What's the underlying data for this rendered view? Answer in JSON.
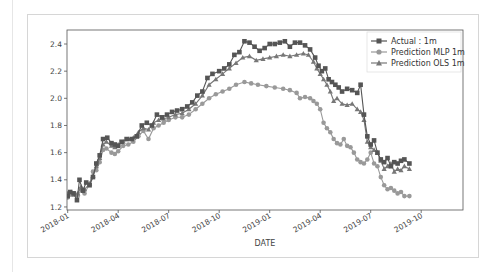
{
  "chart_data": {
    "type": "line",
    "title": "",
    "xlabel": "DATE",
    "ylabel": "",
    "ylim": [
      1.2,
      2.5
    ],
    "xlim": [
      "2018-01-01",
      "2019-12-15"
    ],
    "grid": false,
    "legend_position": "upper right",
    "x_ticks": [
      "2018-01",
      "2018-04",
      "2018-07",
      "2018-10",
      "2019-01",
      "2019-04",
      "2019-07",
      "2019-10"
    ],
    "y_ticks": [
      "1.2",
      "1.4",
      "1.6",
      "1.8",
      "2.0",
      "2.2",
      "2.4"
    ],
    "x_unit_months_from_2018_01": true,
    "series": [
      {
        "name": "Actual : 1m",
        "color": "#555555",
        "marker": "square",
        "points": [
          [
            0,
            1.28
          ],
          [
            0.15,
            1.31
          ],
          [
            0.35,
            1.3
          ],
          [
            0.55,
            1.25
          ],
          [
            0.7,
            1.4
          ],
          [
            0.9,
            1.32
          ],
          [
            1.1,
            1.38
          ],
          [
            1.3,
            1.36
          ],
          [
            1.5,
            1.42
          ],
          [
            1.7,
            1.52
          ],
          [
            1.9,
            1.58
          ],
          [
            2.1,
            1.7
          ],
          [
            2.35,
            1.71
          ],
          [
            2.6,
            1.67
          ],
          [
            2.8,
            1.66
          ],
          [
            3.0,
            1.65
          ],
          [
            3.2,
            1.68
          ],
          [
            3.5,
            1.7
          ],
          [
            3.8,
            1.7
          ],
          [
            4.1,
            1.72
          ],
          [
            4.4,
            1.8
          ],
          [
            4.7,
            1.82
          ],
          [
            5.0,
            1.8
          ],
          [
            5.3,
            1.88
          ],
          [
            5.6,
            1.86
          ],
          [
            5.9,
            1.88
          ],
          [
            6.2,
            1.9
          ],
          [
            6.5,
            1.91
          ],
          [
            6.8,
            1.92
          ],
          [
            7.1,
            1.94
          ],
          [
            7.4,
            1.97
          ],
          [
            7.7,
            2.02
          ],
          [
            8.0,
            2.05
          ],
          [
            8.3,
            2.15
          ],
          [
            8.6,
            2.18
          ],
          [
            9.0,
            2.2
          ],
          [
            9.3,
            2.22
          ],
          [
            9.6,
            2.25
          ],
          [
            9.9,
            2.32
          ],
          [
            10.2,
            2.34
          ],
          [
            10.5,
            2.42
          ],
          [
            10.8,
            2.41
          ],
          [
            11.1,
            2.38
          ],
          [
            11.4,
            2.35
          ],
          [
            11.7,
            2.37
          ],
          [
            12.0,
            2.4
          ],
          [
            12.3,
            2.4
          ],
          [
            12.6,
            2.41
          ],
          [
            12.9,
            2.42
          ],
          [
            13.2,
            2.38
          ],
          [
            13.5,
            2.41
          ],
          [
            13.8,
            2.41
          ],
          [
            14.1,
            2.39
          ],
          [
            14.4,
            2.36
          ],
          [
            14.7,
            2.3
          ],
          [
            14.9,
            2.24
          ],
          [
            15.1,
            2.2
          ],
          [
            15.3,
            2.22
          ],
          [
            15.5,
            2.14
          ],
          [
            15.7,
            2.12
          ],
          [
            15.9,
            2.1
          ],
          [
            16.1,
            2.08
          ],
          [
            16.3,
            2.05
          ],
          [
            16.6,
            2.07
          ],
          [
            16.9,
            2.06
          ],
          [
            17.2,
            2.04
          ],
          [
            17.4,
            2.1
          ],
          [
            17.6,
            1.88
          ],
          [
            17.8,
            1.72
          ],
          [
            18.0,
            1.66
          ],
          [
            18.2,
            1.69
          ],
          [
            18.4,
            1.6
          ],
          [
            18.6,
            1.55
          ],
          [
            18.8,
            1.53
          ],
          [
            19.0,
            1.56
          ],
          [
            19.2,
            1.5
          ],
          [
            19.4,
            1.53
          ],
          [
            19.6,
            1.52
          ],
          [
            19.8,
            1.54
          ],
          [
            20.0,
            1.55
          ],
          [
            20.3,
            1.52
          ]
        ]
      },
      {
        "name": "Prediction MLP 1m",
        "color": "#999999",
        "marker": "circle",
        "points": [
          [
            0,
            1.27
          ],
          [
            0.2,
            1.29
          ],
          [
            0.4,
            1.3
          ],
          [
            0.6,
            1.28
          ],
          [
            0.8,
            1.33
          ],
          [
            1.0,
            1.3
          ],
          [
            1.3,
            1.37
          ],
          [
            1.5,
            1.46
          ],
          [
            1.7,
            1.47
          ],
          [
            1.9,
            1.53
          ],
          [
            2.1,
            1.62
          ],
          [
            2.3,
            1.63
          ],
          [
            2.6,
            1.6
          ],
          [
            2.8,
            1.59
          ],
          [
            3.0,
            1.61
          ],
          [
            3.3,
            1.65
          ],
          [
            3.6,
            1.66
          ],
          [
            3.9,
            1.68
          ],
          [
            4.2,
            1.72
          ],
          [
            4.5,
            1.76
          ],
          [
            4.8,
            1.7
          ],
          [
            5.1,
            1.78
          ],
          [
            5.4,
            1.8
          ],
          [
            5.7,
            1.82
          ],
          [
            6.0,
            1.84
          ],
          [
            6.4,
            1.86
          ],
          [
            6.8,
            1.86
          ],
          [
            7.2,
            1.88
          ],
          [
            7.6,
            1.92
          ],
          [
            8.0,
            1.96
          ],
          [
            8.4,
            2.0
          ],
          [
            8.8,
            2.03
          ],
          [
            9.2,
            2.05
          ],
          [
            9.6,
            2.07
          ],
          [
            10.0,
            2.1
          ],
          [
            10.5,
            2.12
          ],
          [
            10.9,
            2.11
          ],
          [
            11.3,
            2.1
          ],
          [
            11.8,
            2.09
          ],
          [
            12.3,
            2.08
          ],
          [
            12.8,
            2.07
          ],
          [
            13.2,
            2.06
          ],
          [
            13.6,
            2.04
          ],
          [
            13.8,
            2.0
          ],
          [
            14.1,
            2.01
          ],
          [
            14.4,
            2.0
          ],
          [
            14.6,
            1.98
          ],
          [
            14.8,
            1.96
          ],
          [
            15.0,
            1.92
          ],
          [
            15.2,
            1.82
          ],
          [
            15.4,
            1.78
          ],
          [
            15.6,
            1.75
          ],
          [
            15.8,
            1.7
          ],
          [
            16.0,
            1.67
          ],
          [
            16.2,
            1.66
          ],
          [
            16.4,
            1.7
          ],
          [
            16.6,
            1.65
          ],
          [
            16.8,
            1.64
          ],
          [
            17.0,
            1.6
          ],
          [
            17.2,
            1.55
          ],
          [
            17.4,
            1.53
          ],
          [
            17.6,
            1.52
          ],
          [
            17.8,
            1.55
          ],
          [
            18.0,
            1.6
          ],
          [
            18.2,
            1.52
          ],
          [
            18.4,
            1.5
          ],
          [
            18.6,
            1.42
          ],
          [
            18.8,
            1.36
          ],
          [
            19.0,
            1.33
          ],
          [
            19.2,
            1.34
          ],
          [
            19.4,
            1.32
          ],
          [
            19.6,
            1.3
          ],
          [
            19.8,
            1.31
          ],
          [
            20.0,
            1.28
          ],
          [
            20.3,
            1.28
          ]
        ]
      },
      {
        "name": "Prediction OLS 1m",
        "color": "#777777",
        "marker": "triangle",
        "points": [
          [
            0,
            1.3
          ],
          [
            0.2,
            1.31
          ],
          [
            0.4,
            1.29
          ],
          [
            0.6,
            1.3
          ],
          [
            0.8,
            1.35
          ],
          [
            1.0,
            1.33
          ],
          [
            1.3,
            1.37
          ],
          [
            1.5,
            1.43
          ],
          [
            1.7,
            1.5
          ],
          [
            1.9,
            1.56
          ],
          [
            2.1,
            1.66
          ],
          [
            2.3,
            1.68
          ],
          [
            2.6,
            1.65
          ],
          [
            2.8,
            1.64
          ],
          [
            3.0,
            1.66
          ],
          [
            3.3,
            1.68
          ],
          [
            3.6,
            1.7
          ],
          [
            3.9,
            1.71
          ],
          [
            4.2,
            1.75
          ],
          [
            4.5,
            1.78
          ],
          [
            4.8,
            1.77
          ],
          [
            5.1,
            1.82
          ],
          [
            5.4,
            1.84
          ],
          [
            5.7,
            1.85
          ],
          [
            6.0,
            1.86
          ],
          [
            6.4,
            1.88
          ],
          [
            6.8,
            1.89
          ],
          [
            7.2,
            1.92
          ],
          [
            7.6,
            1.96
          ],
          [
            8.0,
            2.02
          ],
          [
            8.4,
            2.1
          ],
          [
            8.8,
            2.14
          ],
          [
            9.2,
            2.18
          ],
          [
            9.6,
            2.22
          ],
          [
            10.0,
            2.26
          ],
          [
            10.4,
            2.3
          ],
          [
            10.8,
            2.31
          ],
          [
            11.2,
            2.28
          ],
          [
            11.6,
            2.29
          ],
          [
            12.0,
            2.3
          ],
          [
            12.4,
            2.31
          ],
          [
            12.8,
            2.32
          ],
          [
            13.2,
            2.31
          ],
          [
            13.6,
            2.32
          ],
          [
            14.0,
            2.33
          ],
          [
            14.3,
            2.32
          ],
          [
            14.6,
            2.27
          ],
          [
            14.8,
            2.22
          ],
          [
            15.0,
            2.18
          ],
          [
            15.2,
            2.14
          ],
          [
            15.4,
            2.1
          ],
          [
            15.6,
            2.05
          ],
          [
            15.8,
            1.98
          ],
          [
            16.0,
            2.0
          ],
          [
            16.3,
            1.96
          ],
          [
            16.6,
            1.95
          ],
          [
            16.9,
            1.96
          ],
          [
            17.2,
            1.92
          ],
          [
            17.4,
            1.9
          ],
          [
            17.6,
            1.84
          ],
          [
            17.8,
            1.68
          ],
          [
            18.0,
            1.64
          ],
          [
            18.2,
            1.62
          ],
          [
            18.4,
            1.6
          ],
          [
            18.6,
            1.54
          ],
          [
            18.8,
            1.48
          ],
          [
            19.0,
            1.5
          ],
          [
            19.2,
            1.52
          ],
          [
            19.4,
            1.46
          ],
          [
            19.6,
            1.48
          ],
          [
            19.8,
            1.47
          ],
          [
            20.0,
            1.5
          ],
          [
            20.3,
            1.48
          ]
        ]
      }
    ]
  },
  "legend": {
    "items": [
      "Actual : 1m",
      "Prediction MLP 1m",
      "Prediction OLS 1m"
    ]
  },
  "axes": {
    "xlabel": "DATE"
  }
}
